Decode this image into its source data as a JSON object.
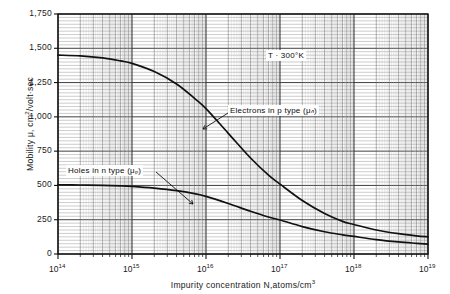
{
  "chart_data": {
    "type": "line",
    "title": "",
    "xlabel": "Impurity concentration N,atoms/cm³",
    "ylabel": "Mobility μ, cm²/volt·sec",
    "xscale": "log",
    "yscale": "linear",
    "xlim": [
      100000000000000.0,
      1e+19
    ],
    "ylim": [
      0,
      1750
    ],
    "grid": true,
    "grid_style": "semi-log graph paper, minor decade divisions on x, fine horizontal rules on y",
    "legend_position": "inline annotations with leader lines",
    "xticks": [
      "10^14",
      "10^15",
      "10^16",
      "10^17",
      "10^18",
      "10^19"
    ],
    "xtick_mantissa": "10",
    "xtick_exponents": [
      "14",
      "15",
      "16",
      "17",
      "18",
      "19"
    ],
    "yticks": [
      0,
      250,
      500,
      750,
      1000,
      1250,
      1500,
      1750
    ],
    "ytick_labels": [
      "0",
      "250",
      "500",
      "750",
      "1,000",
      "1,250",
      "1,500",
      "1,750"
    ],
    "annotations": [
      {
        "id": "temperature",
        "text": "T · 300°K",
        "x": 3e+16,
        "y": 1520
      },
      {
        "id": "electrons-label",
        "text": "Electrons in p type (μₙ)",
        "x": 1.2e+16,
        "y": 1115
      },
      {
        "id": "holes-label",
        "text": "Holes in n type (μₚ)",
        "x": 140000000000000.0,
        "y": 700
      }
    ],
    "series": [
      {
        "name": "Electrons in p type (μₙ)",
        "symbol": "μₙ",
        "color": "#111111",
        "x": [
          100000000000000.0,
          200000000000000.0,
          400000000000000.0,
          700000000000000.0,
          1000000000000000.0,
          2000000000000000.0,
          4000000000000000.0,
          7000000000000000.0,
          1e+16,
          2e+16,
          4e+16,
          7e+16,
          1e+17,
          2e+17,
          4e+17,
          7e+17,
          1e+18,
          2e+18,
          4e+18,
          7e+18,
          1e+19
        ],
        "y": [
          1450,
          1445,
          1430,
          1408,
          1390,
          1330,
          1240,
          1135,
          1060,
          880,
          700,
          575,
          510,
          390,
          295,
          238,
          215,
          175,
          148,
          132,
          125
        ]
      },
      {
        "name": "Holes in n type (μₚ)",
        "symbol": "μₚ",
        "color": "#111111",
        "x": [
          100000000000000.0,
          200000000000000.0,
          400000000000000.0,
          700000000000000.0,
          1000000000000000.0,
          2000000000000000.0,
          4000000000000000.0,
          7000000000000000.0,
          1e+16,
          2e+16,
          4e+16,
          7e+16,
          1e+17,
          2e+17,
          4e+17,
          7e+17,
          1e+18,
          2e+18,
          4e+18,
          7e+18,
          1e+19
        ],
        "y": [
          505,
          503,
          500,
          497,
          493,
          480,
          462,
          440,
          420,
          368,
          312,
          270,
          248,
          200,
          162,
          140,
          128,
          105,
          88,
          78,
          72
        ]
      }
    ]
  }
}
